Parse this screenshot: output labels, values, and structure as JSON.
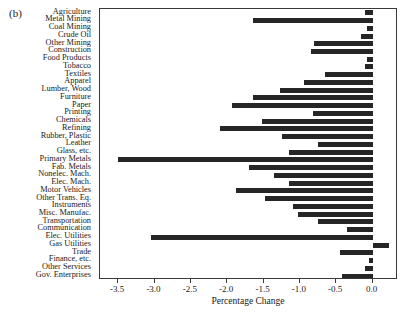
{
  "figure": {
    "panel_label": "(b)"
  },
  "chart_data": {
    "type": "bar",
    "orientation": "horizontal",
    "title": "",
    "xlabel": "Percentage Change",
    "ylabel": "",
    "xlim": [
      -3.75,
      0.35
    ],
    "ylim": [
      0,
      31
    ],
    "grid": false,
    "legend": null,
    "xticks": [
      -3.5,
      -3.0,
      -2.5,
      -2.0,
      -1.5,
      -1.0,
      -0.5,
      0.0
    ],
    "xticklabels": [
      "-3.5",
      "-3.0",
      "-2.5",
      "-2.0",
      "-1.5",
      "-1.0",
      "-0.5",
      "0.0"
    ],
    "bar_color": "#262626",
    "categories": [
      "Agriculture",
      "Metal Mining",
      "Coal Mining",
      "Crude Oil",
      "Other Mining",
      "Construction",
      "Food Products",
      "Tobacco",
      "Textiles",
      "Apparel",
      "Lumber, Wood",
      "Furniture",
      "Paper",
      "Printing",
      "Chemicals",
      "Refining",
      "Rubber, Plastic",
      "Leather",
      "Glass, etc.",
      "Primary Metals",
      "Fab. Metals",
      "Nonelec. Mach.",
      "Elec. Mach.",
      "Motor Vehicles",
      "Other Trans. Eq.",
      "Instruments",
      "Misc. Manufac.",
      "Transportation",
      "Communication",
      "Elec. Utilities",
      "Gas Utilities",
      "Trade",
      "Finance, etc.",
      "Other Services",
      "Gov. Enterprises"
    ],
    "values": [
      -0.1,
      -1.65,
      -0.08,
      -0.16,
      -0.8,
      -0.85,
      -0.07,
      -0.11,
      -0.65,
      -0.95,
      -1.28,
      -1.65,
      -1.93,
      -0.82,
      -1.52,
      -2.1,
      -1.25,
      -0.75,
      -1.15,
      -3.5,
      -1.7,
      -1.35,
      -1.15,
      -1.88,
      -1.48,
      -1.1,
      -1.02,
      -0.75,
      -0.35,
      -3.05,
      0.22,
      -0.45,
      -0.05,
      -0.11,
      -0.42
    ]
  }
}
